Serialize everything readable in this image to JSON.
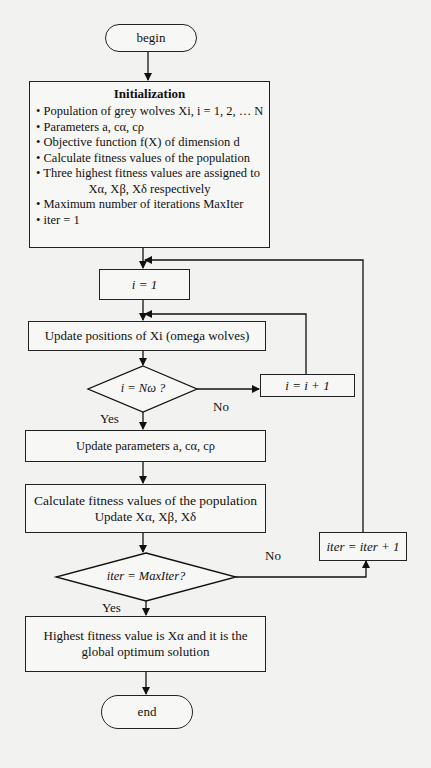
{
  "diagram": {
    "type": "flowchart",
    "nodes": {
      "begin": {
        "label": "begin",
        "shape": "terminal"
      },
      "init": {
        "shape": "process",
        "title": "Initialization",
        "items": [
          "• Population of grey wolves Xi, i = 1, 2, … N",
          "• Parameters a, cα, cρ",
          "• Objective function f(X) of dimension d",
          "• Calculate fitness values of the population",
          "• Three highest fitness values are assigned to",
          "Xα, Xβ, Xδ respectively",
          "• Maximum number of iterations MaxIter",
          "• iter = 1"
        ]
      },
      "i_one": {
        "label": "i = 1",
        "shape": "process"
      },
      "update_positions": {
        "label": "Update positions of Xi (omega wolves)",
        "shape": "process"
      },
      "check_i": {
        "label": "i = Nω ?",
        "shape": "decision"
      },
      "i_increment": {
        "label": "i = i + 1",
        "shape": "process"
      },
      "update_params": {
        "label": "Update parameters a, cα, cρ",
        "shape": "process"
      },
      "calc_fitness": {
        "line1": "Calculate fitness values of the population",
        "line2": "Update Xα, Xβ, Xδ",
        "shape": "process"
      },
      "check_iter": {
        "label": "iter = MaxIter?",
        "shape": "decision"
      },
      "iter_increment": {
        "label": "iter = iter + 1",
        "shape": "process"
      },
      "result": {
        "line1": "Highest fitness value is Xα and it is the",
        "line2": "global optimum solution",
        "shape": "process"
      },
      "end": {
        "label": "end",
        "shape": "terminal"
      }
    },
    "edges": [
      {
        "from": "begin",
        "to": "init"
      },
      {
        "from": "init",
        "to": "i_one"
      },
      {
        "from": "i_one",
        "to": "update_positions"
      },
      {
        "from": "update_positions",
        "to": "check_i"
      },
      {
        "from": "check_i",
        "to": "i_increment",
        "label": "No"
      },
      {
        "from": "i_increment",
        "to": "update_positions"
      },
      {
        "from": "check_i",
        "to": "update_params",
        "label": "Yes"
      },
      {
        "from": "update_params",
        "to": "calc_fitness"
      },
      {
        "from": "calc_fitness",
        "to": "check_iter"
      },
      {
        "from": "check_iter",
        "to": "iter_increment",
        "label": "No"
      },
      {
        "from": "iter_increment",
        "to": "i_one"
      },
      {
        "from": "check_iter",
        "to": "result",
        "label": "Yes"
      },
      {
        "from": "result",
        "to": "end"
      }
    ],
    "edge_labels": {
      "check_i_no": "No",
      "check_i_yes": "Yes",
      "check_iter_no": "No",
      "check_iter_yes": "Yes"
    }
  }
}
